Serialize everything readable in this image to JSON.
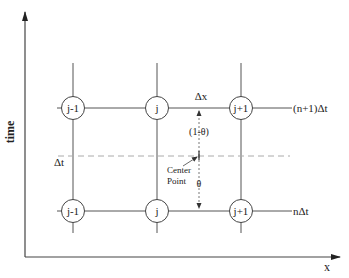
{
  "diagram": {
    "axes": {
      "x_label": "x",
      "y_label": "time"
    },
    "columns": [
      "j-1",
      "j",
      "j+1"
    ],
    "rows": [
      {
        "name": "upper",
        "label": "(n+1)Δt",
        "nodes": [
          "j-1",
          "j",
          "j+1"
        ]
      },
      {
        "name": "lower",
        "label": "nΔt",
        "nodes": [
          "j-1",
          "j",
          "j+1"
        ]
      }
    ],
    "annotations": {
      "delta_x": "Δx",
      "delta_t": "Δt",
      "one_minus_theta": "(1-θ)",
      "theta": "θ",
      "center_point_line1": "Center",
      "center_point_line2": "Point"
    },
    "colors": {
      "line": "#444444",
      "dashed": "#aaaaaa",
      "text": "#222222"
    }
  }
}
